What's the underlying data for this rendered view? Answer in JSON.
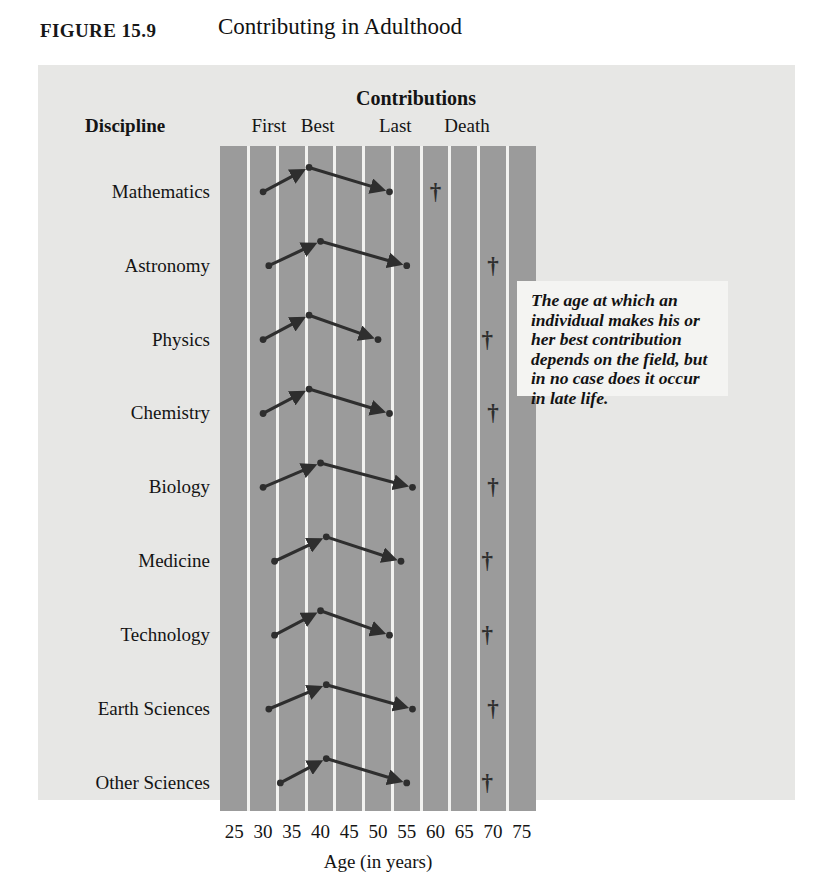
{
  "figure": {
    "number_prefix": "F",
    "number_rest": "IGURE",
    "number": "15.9",
    "number_full": "FIGURE 15.9",
    "title": "Contributing in Adulthood"
  },
  "headers": {
    "group_title": "Contributions",
    "row_axis_label": "Discipline",
    "columns": [
      "First",
      "Best",
      "Last",
      "Death"
    ]
  },
  "callout": {
    "text": "The age at which an individual makes his or her best contribution depends on the field, but in no case does it occur in late life."
  },
  "axis": {
    "title": "Age (in years)",
    "ticks": [
      25,
      30,
      35,
      40,
      45,
      50,
      55,
      60,
      65,
      70,
      75
    ],
    "min": 25,
    "max": 75
  },
  "colors": {
    "page_background": "#ffffff",
    "panel_background": "#e7e7e5",
    "plot_band": "#9b9b9b",
    "gridline": "#f2f2f0",
    "mark": "#2e2e2e",
    "callout_background": "#f4f4f2",
    "text": "#141414"
  },
  "icons": {
    "death_marker": "dagger-icon",
    "arrow_marker": "arrow-icon",
    "point_marker": "dot-icon"
  },
  "chart_data": {
    "type": "scatter",
    "title": "Contributing in Adulthood",
    "xlabel": "Age (in years)",
    "ylabel": "Discipline",
    "xlim": [
      25,
      75
    ],
    "xticks": [
      25,
      30,
      35,
      40,
      45,
      50,
      55,
      60,
      65,
      70,
      75
    ],
    "grid": true,
    "legend": "none",
    "categories": [
      "Mathematics",
      "Astronomy",
      "Physics",
      "Chemistry",
      "Biology",
      "Medicine",
      "Technology",
      "Earth Sciences",
      "Other Sciences"
    ],
    "series": [
      {
        "name": "First contribution",
        "values": [
          30,
          31,
          30,
          30,
          30,
          32,
          32,
          31,
          33
        ]
      },
      {
        "name": "Best contribution",
        "values": [
          38,
          40,
          38,
          38,
          40,
          41,
          40,
          41,
          41
        ]
      },
      {
        "name": "Last contribution",
        "values": [
          52,
          55,
          50,
          52,
          56,
          54,
          52,
          56,
          55
        ]
      },
      {
        "name": "Death",
        "values": [
          60,
          70,
          69,
          70,
          70,
          69,
          69,
          70,
          69
        ]
      }
    ],
    "rows": [
      {
        "discipline": "Mathematics",
        "first": 30,
        "best": 38,
        "last": 52,
        "death": 60
      },
      {
        "discipline": "Astronomy",
        "first": 31,
        "best": 40,
        "last": 55,
        "death": 70
      },
      {
        "discipline": "Physics",
        "first": 30,
        "best": 38,
        "last": 50,
        "death": 69
      },
      {
        "discipline": "Chemistry",
        "first": 30,
        "best": 38,
        "last": 52,
        "death": 70
      },
      {
        "discipline": "Biology",
        "first": 30,
        "best": 40,
        "last": 56,
        "death": 70
      },
      {
        "discipline": "Medicine",
        "first": 32,
        "best": 41,
        "last": 54,
        "death": 69
      },
      {
        "discipline": "Technology",
        "first": 32,
        "best": 40,
        "last": 52,
        "death": 69
      },
      {
        "discipline": "Earth Sciences",
        "first": 31,
        "best": 41,
        "last": 56,
        "death": 70
      },
      {
        "discipline": "Other Sciences",
        "first": 33,
        "best": 41,
        "last": 55,
        "death": 69
      }
    ]
  }
}
